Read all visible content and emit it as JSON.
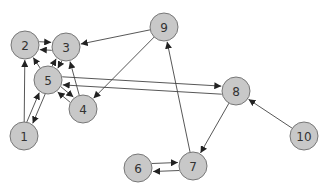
{
  "diagram": {
    "type": "directed-graph",
    "node_radius": 14,
    "colors": {
      "node_fill": "#c8c8c8",
      "node_stroke": "#777777",
      "edge": "#444444",
      "label": "#333333",
      "background": "#ffffff"
    },
    "nodes": [
      {
        "id": "1",
        "label": "1",
        "x": 24,
        "y": 136
      },
      {
        "id": "2",
        "label": "2",
        "x": 25,
        "y": 45
      },
      {
        "id": "3",
        "label": "3",
        "x": 66,
        "y": 47
      },
      {
        "id": "4",
        "label": "4",
        "x": 83,
        "y": 109
      },
      {
        "id": "5",
        "label": "5",
        "x": 48,
        "y": 80
      },
      {
        "id": "6",
        "label": "6",
        "x": 138,
        "y": 168
      },
      {
        "id": "7",
        "label": "7",
        "x": 193,
        "y": 166
      },
      {
        "id": "8",
        "label": "8",
        "x": 236,
        "y": 91
      },
      {
        "id": "9",
        "label": "9",
        "x": 164,
        "y": 27
      },
      {
        "id": "10",
        "label": "10",
        "x": 304,
        "y": 136
      }
    ],
    "edges": [
      {
        "from": "2",
        "to": "3",
        "offset": -4
      },
      {
        "from": "3",
        "to": "2",
        "offset": -4
      },
      {
        "from": "5",
        "to": "2",
        "offset": 0
      },
      {
        "from": "5",
        "to": "3",
        "offset": -3
      },
      {
        "from": "3",
        "to": "5",
        "offset": -3
      },
      {
        "from": "1",
        "to": "2",
        "offset": 0
      },
      {
        "from": "1",
        "to": "5",
        "offset": -3
      },
      {
        "from": "5",
        "to": "1",
        "offset": -3
      },
      {
        "from": "5",
        "to": "4",
        "offset": -3
      },
      {
        "from": "4",
        "to": "5",
        "offset": -3
      },
      {
        "from": "4",
        "to": "3",
        "offset": 0
      },
      {
        "from": "9",
        "to": "3",
        "offset": 0
      },
      {
        "from": "9",
        "to": "4",
        "offset": 0
      },
      {
        "from": "8",
        "to": "5",
        "offset": -4
      },
      {
        "from": "5",
        "to": "8",
        "offset": -4
      },
      {
        "from": "8",
        "to": "7",
        "offset": 0
      },
      {
        "from": "7",
        "to": "9",
        "offset": 0
      },
      {
        "from": "6",
        "to": "7",
        "offset": -4
      },
      {
        "from": "7",
        "to": "6",
        "offset": -4
      },
      {
        "from": "10",
        "to": "8",
        "offset": 0
      }
    ]
  }
}
